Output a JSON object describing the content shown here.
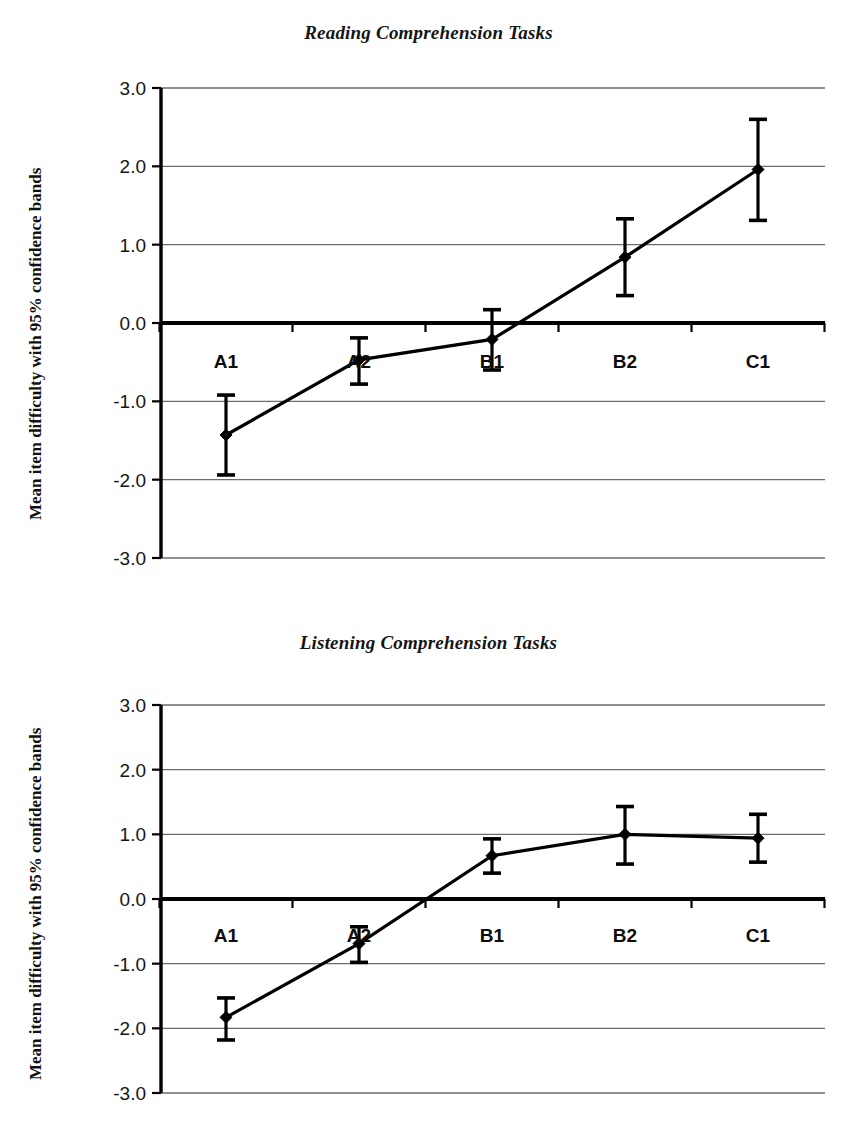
{
  "figure": {
    "ylabel": "Mean item difficulty with 95% confidence bands",
    "categories": [
      "A1",
      "A2",
      "B1",
      "B2",
      "C1"
    ],
    "ytick_labels": [
      "3.0",
      "2.0",
      "1.0",
      "0.0",
      "-1.0",
      "-2.0",
      "-3.0"
    ]
  },
  "chart_data": [
    {
      "type": "line",
      "title": "Reading Comprehension Tasks",
      "xlabel": "",
      "ylabel": "Mean item difficulty with 95% confidence bands",
      "categories": [
        "A1",
        "A2",
        "B1",
        "B2",
        "C1"
      ],
      "values": [
        -1.43,
        -0.47,
        -0.21,
        0.84,
        1.96
      ],
      "error_low": [
        -1.94,
        -0.78,
        -0.6,
        0.35,
        1.31
      ],
      "error_high": [
        -0.92,
        -0.19,
        0.17,
        1.33,
        2.6
      ],
      "ylim": [
        -3.0,
        3.0
      ],
      "yticks": [
        3.0,
        2.0,
        1.0,
        0.0,
        -1.0,
        -2.0,
        -3.0
      ],
      "ytick_labels": [
        "3.0",
        "2.0",
        "1.0",
        "0.0",
        "-1.0",
        "-2.0",
        "-3.0"
      ],
      "grid": true,
      "legend": "none",
      "error_type": "95% confidence band",
      "marker": "diamond"
    },
    {
      "type": "line",
      "title": "Listening Comprehension Tasks",
      "xlabel": "",
      "ylabel": "Mean item difficulty with 95% confidence bands",
      "categories": [
        "A1",
        "A2",
        "B1",
        "B2",
        "C1"
      ],
      "values": [
        -1.83,
        -0.69,
        0.67,
        1.0,
        0.94
      ],
      "error_low": [
        -2.18,
        -0.98,
        0.4,
        0.54,
        0.57
      ],
      "error_high": [
        -1.53,
        -0.43,
        0.93,
        1.43,
        1.31
      ],
      "ylim": [
        -3.0,
        3.0
      ],
      "yticks": [
        3.0,
        2.0,
        1.0,
        0.0,
        -1.0,
        -2.0,
        -3.0
      ],
      "ytick_labels": [
        "3.0",
        "2.0",
        "1.0",
        "0.0",
        "-1.0",
        "-2.0",
        "-3.0"
      ],
      "grid": true,
      "legend": "none",
      "error_type": "95% confidence band",
      "marker": "diamond"
    }
  ]
}
